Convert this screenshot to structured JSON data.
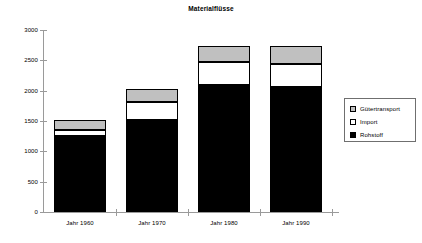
{
  "chart_data": {
    "type": "bar",
    "subtype": "stacked",
    "title": "Materialflüsse",
    "xlabel": "",
    "ylabel": "",
    "categories": [
      "Jahr 1960",
      "Jahr 1970",
      "Jahr 1980",
      "Jahr 1990"
    ],
    "series": [
      {
        "name": "Rohstoff",
        "color": "#000000",
        "values": [
          1250,
          1510,
          2090,
          2060
        ]
      },
      {
        "name": "Import",
        "color": "#ffffff",
        "values": [
          100,
          300,
          390,
          380
        ]
      },
      {
        "name": "Gütertransport",
        "color": "#c0c0c0",
        "values": [
          160,
          220,
          250,
          300
        ]
      }
    ],
    "totals": [
      1510,
      2030,
      2730,
      2740
    ],
    "ylim": [
      0,
      3000
    ],
    "ytick_values": [
      3000,
      2500,
      2000,
      1500,
      1000,
      500,
      0
    ],
    "ytick_labels": [
      "3000",
      "2500",
      "2000",
      "1500",
      "1000",
      "500",
      "0"
    ],
    "grid": false,
    "legend_position": "right"
  },
  "legend": {
    "entries": [
      {
        "label": "Gütertransport",
        "swatch": "#c0c0c0"
      },
      {
        "label": "Import",
        "swatch": "#ffffff"
      },
      {
        "label": "Rohstoff",
        "swatch": "#000000"
      }
    ]
  }
}
